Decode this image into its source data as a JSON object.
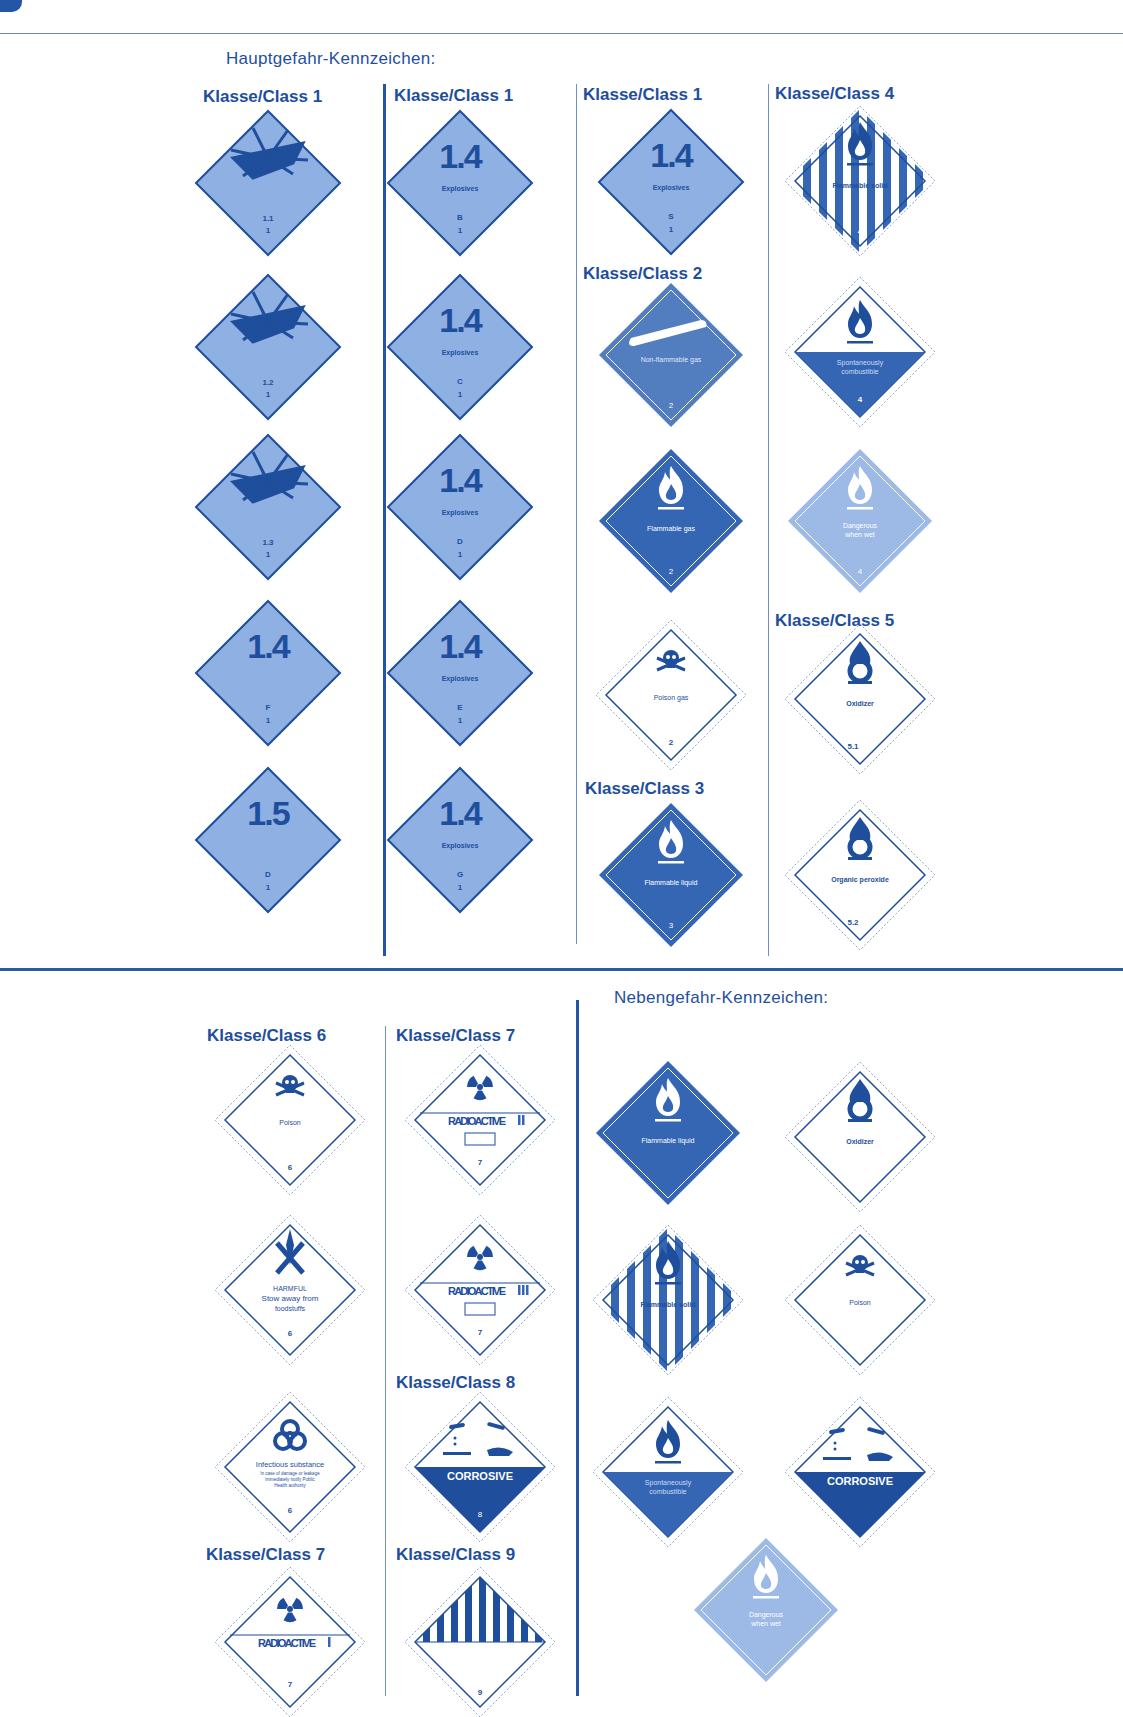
{
  "colors": {
    "primary": "#2356a6",
    "explosive_fill": "#8fb0e2",
    "dark_fill": "#3466b4",
    "light_fill": "#9db9e6",
    "line": "#1e4e9c"
  },
  "main_hazard": {
    "title": "Hauptgefahr-Kennzeichen:",
    "columns": [
      {
        "heading": "Klasse/Class 1",
        "labels": [
          {
            "type": "explosive-bomb",
            "division": "1.1",
            "class": "1"
          },
          {
            "type": "explosive-bomb",
            "division": "1.2",
            "class": "1"
          },
          {
            "type": "explosive-bomb",
            "division": "1.3",
            "class": "1"
          },
          {
            "type": "explosive-number",
            "big": "1.4",
            "text": "",
            "group": "F",
            "class": "1"
          },
          {
            "type": "explosive-number",
            "big": "1.5",
            "text": "",
            "group": "D",
            "class": "1"
          }
        ]
      },
      {
        "heading": "Klasse/Class 1",
        "labels": [
          {
            "type": "explosive-number",
            "big": "1.4",
            "text": "Explosives",
            "group": "B",
            "class": "1"
          },
          {
            "type": "explosive-number",
            "big": "1.4",
            "text": "Explosives",
            "group": "C",
            "class": "1"
          },
          {
            "type": "explosive-number",
            "big": "1.4",
            "text": "Explosives",
            "group": "D",
            "class": "1"
          },
          {
            "type": "explosive-number",
            "big": "1.4",
            "text": "Explosives",
            "group": "E",
            "class": "1"
          },
          {
            "type": "explosive-number",
            "big": "1.4",
            "text": "Explosives",
            "group": "G",
            "class": "1"
          }
        ]
      },
      {
        "headings": [
          "Klasse/Class 1",
          "Klasse/Class 2",
          "Klasse/Class 3"
        ],
        "labels": [
          {
            "type": "explosive-number",
            "big": "1.4",
            "text": "Explosives",
            "group": "S",
            "class": "1"
          },
          {
            "type": "gas-cylinder",
            "text": "Non-flammable gas",
            "class": "2"
          },
          {
            "type": "flame-dark",
            "text": "Flammable gas",
            "class": "2"
          },
          {
            "type": "skull",
            "text": "Poison gas",
            "class": "2"
          },
          {
            "type": "flame-dark",
            "text": "Flammable liquid",
            "class": "3"
          }
        ]
      },
      {
        "headings": [
          "Klasse/Class 4",
          "Klasse/Class 5"
        ],
        "labels": [
          {
            "type": "stripes-flame",
            "text": "Flammable solid",
            "class": "4"
          },
          {
            "type": "half-flame",
            "text1": "Spontaneously",
            "text2": "combustible",
            "class": "4"
          },
          {
            "type": "flame-light",
            "text1": "Dangerous",
            "text2": "when wet",
            "class": "4"
          },
          {
            "type": "oxidizer",
            "text": "Oxidizer",
            "class": "5.1"
          },
          {
            "type": "oxidizer",
            "text": "Organic peroxide",
            "class": "5.2"
          }
        ]
      }
    ]
  },
  "lower": {
    "columns": [
      {
        "headings": [
          "Klasse/Class 6",
          "Klasse/Class 7"
        ],
        "labels": [
          {
            "type": "skull",
            "text": "Poison",
            "class": "6"
          },
          {
            "type": "harmful",
            "text1": "HARMFUL",
            "text2": "Stow away from",
            "text3": "foodstuffs",
            "class": "6"
          },
          {
            "type": "biohazard",
            "text1": "Infectious substance",
            "text2": "In case of damage or leakage",
            "text3": "immediately notify Public",
            "text4": "Health authority",
            "class": "6"
          },
          {
            "type": "radioactive",
            "text": "RADIOACTIVE",
            "bars": "I",
            "class": "7"
          }
        ]
      },
      {
        "headings": [
          "Klasse/Class 7",
          "Klasse/Class 8",
          "Klasse/Class 9"
        ],
        "labels": [
          {
            "type": "radioactive",
            "text": "RADIOACTIVE",
            "bars": "II",
            "class": "7"
          },
          {
            "type": "radioactive",
            "text": "RADIOACTIVE",
            "bars": "III",
            "class": "7"
          },
          {
            "type": "corrosive",
            "text": "CORROSIVE",
            "class": "8"
          },
          {
            "type": "misc-stripes",
            "class": "9"
          }
        ]
      }
    ]
  },
  "subsidiary_hazard": {
    "title": "Nebengefahr-Kennzeichen:",
    "labels": [
      {
        "type": "flame-dark",
        "text": "Flammable liquid"
      },
      {
        "type": "oxidizer",
        "text": "Oxidizer"
      },
      {
        "type": "stripes-flame",
        "text": "Flammable solid"
      },
      {
        "type": "skull",
        "text": "Poison"
      },
      {
        "type": "half-flame",
        "text1": "Spontaneously",
        "text2": "combustible"
      },
      {
        "type": "corrosive",
        "text": "CORROSIVE"
      },
      {
        "type": "flame-light",
        "text1": "Dangerous",
        "text2": "when wet"
      }
    ]
  }
}
